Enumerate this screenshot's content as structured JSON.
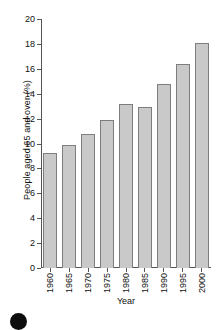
{
  "chart_data": {
    "type": "bar",
    "title": "",
    "xlabel": "Year",
    "ylabel": "People aged 65 and over (%)",
    "categories": [
      "1960",
      "1965",
      "1970",
      "1975",
      "1980",
      "1985",
      "1990",
      "1995",
      "2000"
    ],
    "values": [
      9.2,
      9.9,
      10.8,
      11.9,
      13.2,
      12.9,
      14.8,
      16.4,
      18.1
    ],
    "ylim": [
      0,
      20
    ],
    "yticks": [
      "20",
      "18",
      "16",
      "14",
      "12",
      "10",
      "8",
      "6",
      "4",
      "2",
      "0"
    ],
    "ytick_values": [
      20,
      18,
      16,
      14,
      12,
      10,
      8,
      6,
      4,
      2,
      0
    ],
    "grid": false,
    "legend": null,
    "bar_color": "#c9c9c9",
    "bar_edge_color": "#7d7d7d",
    "axis_color": "#555555",
    "background": "#ffffff"
  },
  "decorations": {
    "bullet_glyph": "filled-circle"
  }
}
